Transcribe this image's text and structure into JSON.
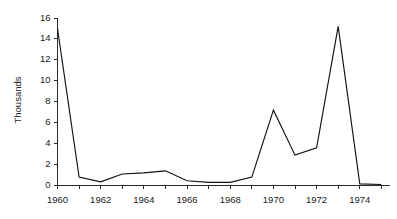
{
  "chart_data": {
    "type": "line",
    "title": "",
    "xlabel": "",
    "ylabel": "Thousands",
    "x": [
      1960,
      1961,
      1962,
      1963,
      1964,
      1965,
      1966,
      1967,
      1968,
      1969,
      1970,
      1971,
      1972,
      1973,
      1974,
      1975
    ],
    "values": [
      15.0,
      0.8,
      0.35,
      1.1,
      1.2,
      1.4,
      0.45,
      0.3,
      0.3,
      0.8,
      7.2,
      2.9,
      3.6,
      15.2,
      0.15,
      0.1
    ],
    "series": [
      {
        "name": "",
        "values": [
          15.0,
          0.8,
          0.35,
          1.1,
          1.2,
          1.4,
          0.45,
          0.3,
          0.3,
          0.8,
          7.2,
          2.9,
          3.6,
          15.2,
          0.15,
          0.1
        ]
      }
    ],
    "xlim": [
      1960,
      1975.4
    ],
    "ylim": [
      0,
      16
    ],
    "ytick_values": [
      0,
      2,
      4,
      6,
      8,
      10,
      12,
      14,
      16
    ],
    "ytick_labels": [
      "0",
      "2",
      "4",
      "6",
      "8",
      "10",
      "12",
      "14",
      "16"
    ],
    "xtick_values": [
      1960,
      1961,
      1962,
      1963,
      1964,
      1965,
      1966,
      1967,
      1968,
      1969,
      1970,
      1971,
      1972,
      1973,
      1974,
      1975
    ],
    "xtick_labeled": [
      1960,
      1962,
      1964,
      1966,
      1968,
      1970,
      1972,
      1974
    ],
    "xtick_labels": [
      "1960",
      "1962",
      "1964",
      "1966",
      "1968",
      "1970",
      "1972",
      "1974"
    ],
    "grid": false,
    "legend": false,
    "legend_position": "none",
    "line_color": "#111111",
    "axis_color": "#2b2b2b",
    "background_color": "#ffffff"
  },
  "axis_titles": {
    "y": "Thousands"
  }
}
